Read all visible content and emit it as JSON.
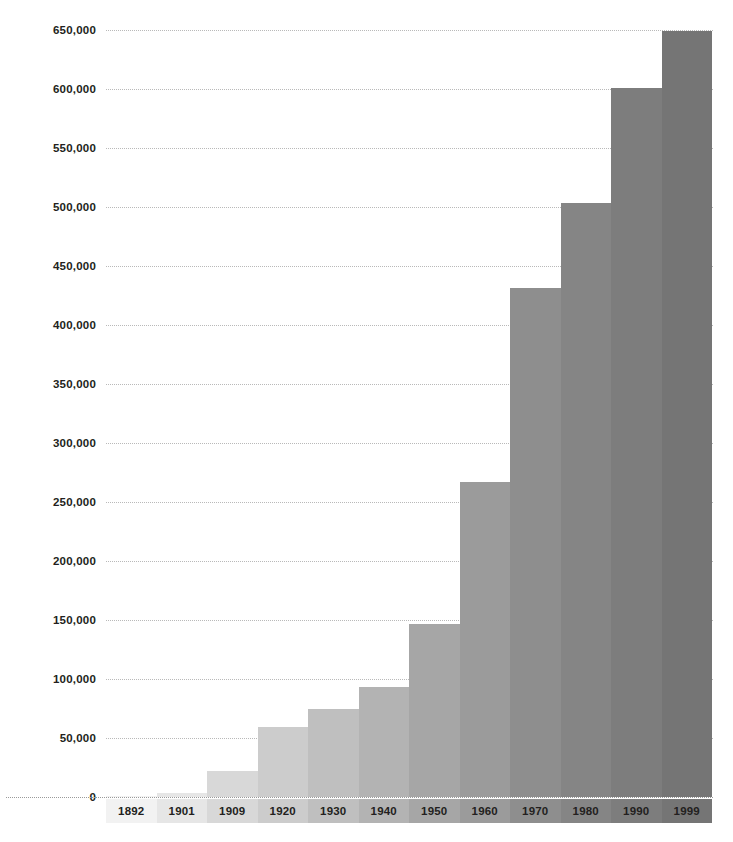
{
  "chart_data": {
    "type": "bar",
    "title": "",
    "subtitle": "",
    "xlabel": "",
    "ylabel": "",
    "categories": [
      "1892",
      "1901",
      "1909",
      "1920",
      "1930",
      "1940",
      "1950",
      "1960",
      "1970",
      "1980",
      "1990",
      "1999"
    ],
    "values": [
      1000,
      3000,
      22000,
      59000,
      75000,
      93000,
      147000,
      267000,
      431000,
      503000,
      601000,
      649000
    ],
    "value_labels": [
      "1,000",
      "3,000",
      "22,000",
      "59,000",
      "75,000",
      "93,000",
      "147,000",
      "267,000",
      "431,000",
      "503,000",
      "601,000",
      "649,000"
    ],
    "bar_colors": [
      "#f2f2f2",
      "#e6e6e6",
      "#d8d8d8",
      "#cccccc",
      "#bfbfbf",
      "#b3b3b3",
      "#a6a6a6",
      "#9b9b9b",
      "#8e8e8e",
      "#858585",
      "#7d7d7d",
      "#757575"
    ],
    "ylim": [
      0,
      650000
    ],
    "ytick_values": [
      0,
      50000,
      100000,
      150000,
      200000,
      250000,
      300000,
      350000,
      400000,
      450000,
      500000,
      550000,
      600000,
      650000
    ],
    "ytick_labels": [
      "0",
      "50,000",
      "100,000",
      "150,000",
      "200,000",
      "250,000",
      "300,000",
      "350,000",
      "400,000",
      "450,000",
      "500,000",
      "550,000",
      "600,000",
      "650,000"
    ],
    "grid": true,
    "gridline_style": "dotted",
    "gridline_color": "#b9b9b9",
    "legend": false,
    "legend_position": "none",
    "axis_label_band": true,
    "background_color": "#ffffff",
    "text_color": "#231f20"
  }
}
